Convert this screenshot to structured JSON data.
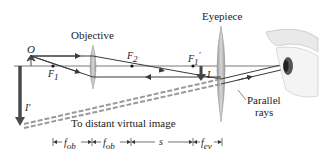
{
  "diagram": {
    "labels": {
      "objective": "Objective",
      "eyepiece": "Eyepiece",
      "object": "O",
      "f1": "F",
      "f1_sub": "1",
      "f2": "F",
      "f2_sub": "2",
      "f1_prime": "F",
      "f1_prime_sub": "1",
      "f1_prime_mark": "′",
      "image_I": "I",
      "image_I_prime": "I′",
      "parallel_rays_line1": "Parallel",
      "parallel_rays_line2": "rays",
      "virtual_image": "To distant virtual image"
    },
    "dimensions": [
      {
        "name": "fob-1",
        "label": "f",
        "sub": "ob"
      },
      {
        "name": "fob-2",
        "label": "f",
        "sub": "ob"
      },
      {
        "name": "s",
        "label": "s",
        "sub": ""
      },
      {
        "name": "fev",
        "label": "f",
        "sub": "ev"
      }
    ],
    "colors": {
      "ray": "#3a3a3a",
      "axis": "#555555",
      "lens": "#b8b8b8",
      "lens_edge": "#8e8e8e",
      "image_arrow": "#4a4a4a",
      "virtual_ray": "#9a9a9a"
    }
  }
}
